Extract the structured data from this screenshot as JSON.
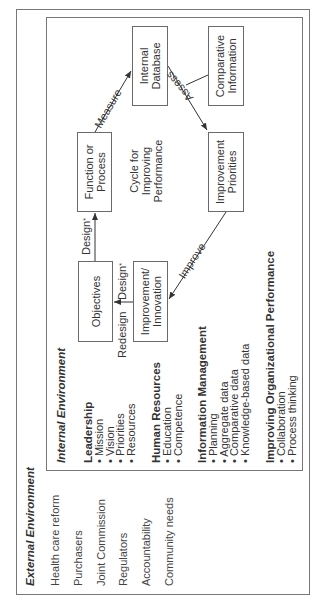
{
  "external_environment": {
    "title": "External Environment",
    "items": [
      "Health care reform",
      "Purchasers",
      "Joint Commission",
      "Regulators",
      "Accountability",
      "Community needs"
    ]
  },
  "internal_environment": {
    "title": "Internal Environment",
    "categories": [
      {
        "heading": "Leadership",
        "items": [
          "Mission",
          "Vision",
          "Priorities",
          "Resources"
        ]
      },
      {
        "heading": "Human Resources",
        "items": [
          "Education",
          "Competence"
        ]
      },
      {
        "heading": "Information Management",
        "items": [
          "Planning",
          "Aggregate data",
          "Comparative data",
          "Knowledge-based data"
        ]
      },
      {
        "heading": "Improving Organizational Performance",
        "items": [
          "Collaboration",
          "Process thinking"
        ]
      }
    ]
  },
  "cycle": {
    "center_label_line1": "Cycle for",
    "center_label_line2": "Improving",
    "center_label_line3": "Performance",
    "nodes": {
      "objectives": "Objectives",
      "improvement_innovation_line1": "Improvement/",
      "improvement_innovation_line2": "Innovation",
      "function_line1": "Function or",
      "function_line2": "Process",
      "internal_db_line1": "Internal",
      "internal_db_line2": "Database",
      "comparative_line1": "Comparative",
      "comparative_line2": "Information",
      "priorities_line1": "Improvement",
      "priorities_line2": "Priorities"
    },
    "edges": {
      "design_1": "Design",
      "design_2": "Design",
      "design_mark": "*",
      "redesign": "Redesign",
      "measure": "Measure",
      "assess": "Assess",
      "improve": "Improve"
    }
  }
}
